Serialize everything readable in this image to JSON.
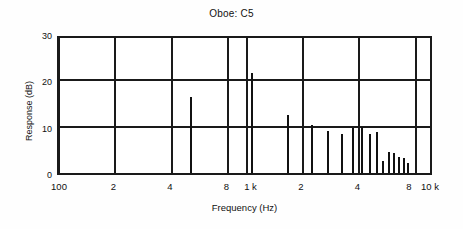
{
  "chart_data": {
    "type": "bar",
    "title": "Oboe: C5",
    "xlabel": "Frequency (Hz)",
    "ylabel": "Response (dB)",
    "xscale": "log",
    "xlim": [
      100,
      10000
    ],
    "ylim": [
      0,
      30
    ],
    "yticks": [
      0,
      10,
      20,
      30
    ],
    "ytick_labels": [
      "0",
      "10",
      "20",
      "30"
    ],
    "xticks": [
      100,
      200,
      400,
      800,
      1000,
      2000,
      4000,
      8000,
      10000
    ],
    "xtick_labels": [
      "100",
      "2",
      "4",
      "8",
      "1 k",
      "2",
      "4",
      "8",
      "10 k"
    ],
    "gridlines_v": [
      100,
      200,
      400,
      800,
      1000,
      2000,
      4000,
      8000
    ],
    "gridlines_h": [
      10,
      20
    ],
    "grid": true,
    "legend": false,
    "series_name": "Harmonic response",
    "x": [
      523,
      1046,
      1569,
      2092,
      2615,
      3138,
      3661,
      4184,
      4707,
      5230,
      5753,
      6276,
      6799,
      7322,
      7845,
      8368
    ],
    "values": [
      16.5,
      21.5,
      12.5,
      10.3,
      9.0,
      8.4,
      9.8,
      9.9,
      8.4,
      8.8,
      2.7,
      4.6,
      4.3,
      3.4,
      3.2,
      2.2
    ],
    "bar_pixel_positions": [
      189,
      250,
      286,
      310,
      326,
      340,
      351,
      360,
      368,
      375,
      381,
      387,
      392,
      397,
      402,
      406
    ]
  },
  "chart": {
    "title": "Oboe: C5",
    "xlabel": "Frequency (Hz)",
    "ylabel": "Response (dB)"
  }
}
